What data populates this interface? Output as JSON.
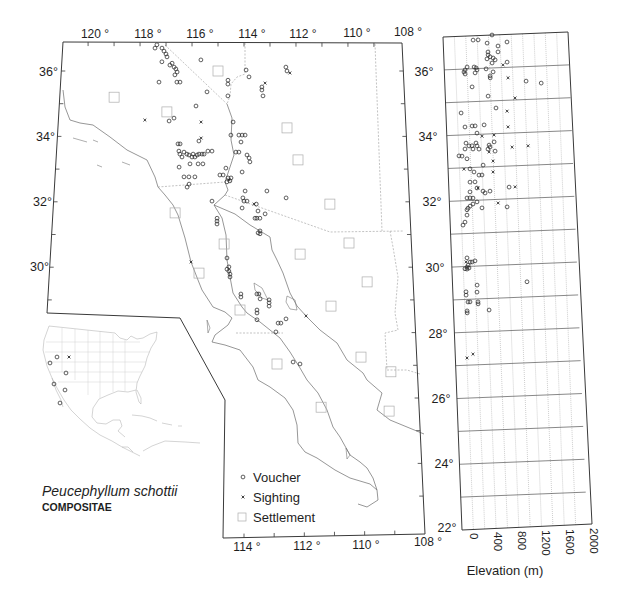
{
  "title": {
    "species": "Peucephyllum schottii",
    "family": "COMPOSITAE"
  },
  "legend": {
    "items": [
      {
        "label": "Voucher",
        "symbol": "circle"
      },
      {
        "label": "Sighting",
        "symbol": "cross"
      },
      {
        "label": "Settlement",
        "symbol": "square"
      }
    ]
  },
  "map": {
    "axes": {
      "top": [
        "120 °",
        "118 °",
        "116 °",
        "114 °",
        "112 °",
        "110 °",
        "108 °"
      ],
      "bottom": [
        "114 °",
        "112 °",
        "110 °",
        "108 °"
      ],
      "left": [
        "36°",
        "34°",
        "32°",
        "30°"
      ],
      "right": [
        "36°",
        "34°",
        "32°",
        "30°",
        "28°",
        "26°",
        "24°",
        "22°"
      ]
    },
    "voucher_points_lat_lonW": [
      [
        36.7,
        117.42
      ],
      [
        36.8,
        117.35
      ],
      [
        36.7,
        117.15
      ],
      [
        36.61,
        117.07
      ],
      [
        36.52,
        116.99
      ],
      [
        36.43,
        116.95
      ],
      [
        36.28,
        117.14
      ],
      [
        36.18,
        116.83
      ],
      [
        36.24,
        116.75
      ],
      [
        36.12,
        116.67
      ],
      [
        36.06,
        116.6
      ],
      [
        35.97,
        116.55
      ],
      [
        35.88,
        116.63
      ],
      [
        35.66,
        117.23
      ],
      [
        35.66,
        116.55
      ],
      [
        35.66,
        116.43
      ],
      [
        36.34,
        115.65
      ],
      [
        35.36,
        115.4
      ],
      [
        34.93,
        115.81
      ],
      [
        34.47,
        116.81
      ],
      [
        34.56,
        116.63
      ],
      [
        35.72,
        114.61
      ],
      [
        35.6,
        114.61
      ],
      [
        35.24,
        114.61
      ],
      [
        36.03,
        113.92
      ],
      [
        35.82,
        113.81
      ],
      [
        35.51,
        113.32
      ],
      [
        35.42,
        113.32
      ],
      [
        35.24,
        113.28
      ],
      [
        36.12,
        112.4
      ],
      [
        36.0,
        112.36
      ],
      [
        34.44,
        114.41
      ],
      [
        34.04,
        114.49
      ],
      [
        34.04,
        114.19
      ],
      [
        34.04,
        114.07
      ],
      [
        34.04,
        113.96
      ],
      [
        33.83,
        114.11
      ],
      [
        33.52,
        114.3
      ],
      [
        33.52,
        114.19
      ],
      [
        33.43,
        113.89
      ],
      [
        33.34,
        113.81
      ],
      [
        33.22,
        113.78
      ],
      [
        32.91,
        114.07
      ],
      [
        32.33,
        113.96
      ],
      [
        32.33,
        113.16
      ],
      [
        32.12,
        112.46
      ],
      [
        33.86,
        115.68
      ],
      [
        33.77,
        116.46
      ],
      [
        33.77,
        116.38
      ],
      [
        33.55,
        116.42
      ],
      [
        33.46,
        116.38
      ],
      [
        33.37,
        116.3
      ],
      [
        33.52,
        116.23
      ],
      [
        33.46,
        116.12
      ],
      [
        33.43,
        116.04
      ],
      [
        33.37,
        115.93
      ],
      [
        33.46,
        115.89
      ],
      [
        33.37,
        115.82
      ],
      [
        33.43,
        115.74
      ],
      [
        33.46,
        115.67
      ],
      [
        33.46,
        115.56
      ],
      [
        33.46,
        115.48
      ],
      [
        33.55,
        115.34
      ],
      [
        33.55,
        115.19
      ],
      [
        33.16,
        116.0
      ],
      [
        33.16,
        115.7
      ],
      [
        33.16,
        115.52
      ],
      [
        33.06,
        116.4
      ],
      [
        32.76,
        116.21
      ],
      [
        32.76,
        116.03
      ],
      [
        32.76,
        115.81
      ],
      [
        32.45,
        116.09
      ],
      [
        32.54,
        116.02
      ],
      [
        33.03,
        114.67
      ],
      [
        32.82,
        114.89
      ],
      [
        32.82,
        114.77
      ],
      [
        32.73,
        114.59
      ],
      [
        32.64,
        114.52
      ],
      [
        32.73,
        114.48
      ],
      [
        32.61,
        114.63
      ],
      [
        32.02,
        115.17
      ],
      [
        32.12,
        114.04
      ],
      [
        32.02,
        114.0
      ],
      [
        32.02,
        113.89
      ],
      [
        31.81,
        114.07
      ],
      [
        31.93,
        113.55
      ],
      [
        31.72,
        113.49
      ],
      [
        31.63,
        113.23
      ],
      [
        31.5,
        113.6
      ],
      [
        31.5,
        113.53
      ],
      [
        31.5,
        113.42
      ],
      [
        31.5,
        114.98
      ],
      [
        31.41,
        114.98
      ],
      [
        31.32,
        114.98
      ],
      [
        31.11,
        113.42
      ],
      [
        31.05,
        113.49
      ],
      [
        31.02,
        113.42
      ],
      [
        30.28,
        114.61
      ],
      [
        30.01,
        114.54
      ],
      [
        29.94,
        114.61
      ],
      [
        29.88,
        114.54
      ],
      [
        29.79,
        114.5
      ],
      [
        29.7,
        114.5
      ],
      [
        29.18,
        114.11
      ],
      [
        29.09,
        114.11
      ],
      [
        29.18,
        113.54
      ],
      [
        29.18,
        113.47
      ],
      [
        29.03,
        113.43
      ],
      [
        29.0,
        113.11
      ],
      [
        28.91,
        113.11
      ],
      [
        28.81,
        113.11
      ],
      [
        28.69,
        113.54
      ],
      [
        28.6,
        113.54
      ],
      [
        28.39,
        113.54
      ],
      [
        28.29,
        112.8
      ],
      [
        28.29,
        112.7
      ],
      [
        28.42,
        112.52
      ],
      [
        28.02,
        112.88
      ],
      [
        27.1,
        112.29
      ],
      [
        27.04,
        112.05
      ]
    ],
    "sighting_points_lat_lonW": [
      [
        34.5,
        117.72
      ],
      [
        34.44,
        115.61
      ],
      [
        33.95,
        115.6
      ],
      [
        35.63,
        113.2
      ],
      [
        35.94,
        112.25
      ],
      [
        30.16,
        115.9
      ],
      [
        28.51,
        111.81
      ],
      [
        31.93,
        113.63
      ],
      [
        32.67,
        114.55
      ]
    ],
    "settlement_points_lat_lonW": [
      [
        35.2,
        118.91
      ],
      [
        36.0,
        114.99
      ],
      [
        34.75,
        116.9
      ],
      [
        34.26,
        112.39
      ],
      [
        33.28,
        112.0
      ],
      [
        31.93,
        110.86
      ],
      [
        31.66,
        116.51
      ],
      [
        30.71,
        114.72
      ],
      [
        30.74,
        110.21
      ],
      [
        30.4,
        111.98
      ],
      [
        29.82,
        115.61
      ],
      [
        29.55,
        109.61
      ],
      [
        28.81,
        110.92
      ],
      [
        28.69,
        114.14
      ],
      [
        27.04,
        112.85
      ],
      [
        27.25,
        109.92
      ],
      [
        26.8,
        108.9
      ],
      [
        25.72,
        111.35
      ],
      [
        25.6,
        109.02
      ]
    ]
  },
  "inset": {
    "voucher_points": [
      [
        57,
        357
      ],
      [
        50,
        363
      ],
      [
        66,
        373
      ],
      [
        54,
        384
      ],
      [
        65,
        390
      ],
      [
        60,
        403
      ]
    ],
    "sighting_points": [
      [
        69,
        357
      ]
    ]
  },
  "chart_data": {
    "type": "scatter",
    "title": "",
    "xlabel": "Elevation (m)",
    "ylabel": "",
    "xlim": [
      -200,
      2000
    ],
    "ylim": [
      22,
      37
    ],
    "x_ticks": [
      0,
      400,
      800,
      1200,
      1600,
      2000
    ],
    "x_tick_labels": [
      "0",
      "400",
      "800",
      "1200",
      "1600",
      "2000"
    ],
    "y_ticks": [
      22,
      24,
      26,
      28,
      30,
      32,
      34,
      36
    ],
    "grid": true,
    "legend_position": "shared with map legend",
    "series": [
      {
        "name": "Voucher",
        "marker": "circle",
        "points_elev_lat": [
          [
            662,
            37.0
          ],
          [
            326,
            36.87
          ],
          [
            414,
            36.87
          ],
          [
            570,
            36.76
          ],
          [
            761,
            36.66
          ],
          [
            922,
            36.77
          ],
          [
            581,
            36.49
          ],
          [
            581,
            36.4
          ],
          [
            614,
            36.34
          ],
          [
            559,
            36.28
          ],
          [
            667,
            36.3
          ],
          [
            757,
            36.48
          ],
          [
            700,
            36.24
          ],
          [
            645,
            36.15
          ],
          [
            909,
            36.16
          ],
          [
            203,
            36.06
          ],
          [
            165,
            35.97
          ],
          [
            146,
            35.91
          ],
          [
            163,
            35.85
          ],
          [
            326,
            36.05
          ],
          [
            360,
            36.02
          ],
          [
            376,
            35.96
          ],
          [
            339,
            35.87
          ],
          [
            535,
            35.98
          ],
          [
            656,
            35.88
          ],
          [
            601,
            35.76
          ],
          [
            601,
            35.7
          ],
          [
            1231,
            35.56
          ],
          [
            1494,
            35.48
          ],
          [
            277,
            35.45
          ],
          [
            552,
            35.15
          ],
          [
            684,
            34.78
          ],
          [
            66,
            34.67
          ],
          [
            126,
            34.24
          ],
          [
            251,
            34.26
          ],
          [
            304,
            34.26
          ],
          [
            462,
            34.28
          ],
          [
            333,
            34.04
          ],
          [
            133,
            33.75
          ],
          [
            183,
            33.66
          ],
          [
            236,
            33.66
          ],
          [
            309,
            33.74
          ],
          [
            324,
            33.65
          ],
          [
            357,
            33.55
          ],
          [
            251,
            33.56
          ],
          [
            111,
            33.57
          ],
          [
            537,
            33.66
          ],
          [
            552,
            33.6
          ],
          [
            515,
            33.54
          ],
          [
            627,
            33.75
          ],
          [
            638,
            33.47
          ],
          [
            0,
            33.37
          ],
          [
            53,
            33.36
          ],
          [
            139,
            33.27
          ],
          [
            418,
            33.06
          ],
          [
            185,
            32.96
          ],
          [
            253,
            32.86
          ],
          [
            339,
            32.76
          ],
          [
            392,
            32.76
          ],
          [
            176,
            32.56
          ],
          [
            264,
            32.56
          ],
          [
            860,
            32.36
          ],
          [
            295,
            32.37
          ],
          [
            398,
            32.27
          ],
          [
            434,
            32.21
          ],
          [
            522,
            32.26
          ],
          [
            170,
            32.26
          ],
          [
            112,
            32.08
          ],
          [
            165,
            32.08
          ],
          [
            218,
            32.07
          ],
          [
            286,
            31.95
          ],
          [
            214,
            31.89
          ],
          [
            161,
            31.83
          ],
          [
            123,
            31.77
          ],
          [
            105,
            31.72
          ],
          [
            370,
            31.76
          ],
          [
            812,
            31.76
          ],
          [
            101,
            31.56
          ],
          [
            62,
            31.35
          ],
          [
            24,
            31.26
          ],
          [
            73,
            30.26
          ],
          [
            123,
            30.13
          ],
          [
            159,
            30.13
          ],
          [
            211,
            30.16
          ],
          [
            86,
            30.04
          ],
          [
            68,
            29.98
          ],
          [
            29,
            29.93
          ],
          [
            64,
            29.92
          ],
          [
            101,
            29.95
          ],
          [
            231,
            29.42
          ],
          [
            225,
            29.21
          ],
          [
            31,
            29.23
          ],
          [
            31,
            29.13
          ],
          [
            60,
            28.92
          ],
          [
            95,
            28.92
          ],
          [
            236,
            28.91
          ],
          [
            236,
            28.85
          ],
          [
            425,
            28.65
          ],
          [
            38,
            28.65
          ],
          [
            38,
            28.59
          ],
          [
            1111,
            29.46
          ]
        ]
      },
      {
        "name": "Sighting",
        "marker": "cross",
        "points_elev_lat": [
          [
            836,
            36.08
          ],
          [
            915,
            35.68
          ],
          [
            1025,
            35.06
          ],
          [
            876,
            34.67
          ],
          [
            882,
            34.19
          ],
          [
            419,
            33.94
          ],
          [
            631,
            33.96
          ],
          [
            532,
            33.45
          ],
          [
            940,
            33.57
          ],
          [
            1222,
            33.59
          ],
          [
            596,
            33.17
          ],
          [
            79,
            32.96
          ],
          [
            588,
            32.84
          ],
          [
            966,
            32.36
          ],
          [
            313,
            32.37
          ],
          [
            656,
            31.89
          ],
          [
            53,
            30.14
          ],
          [
            112,
            27.33
          ],
          [
            5,
            27.22
          ]
        ]
      }
    ]
  }
}
